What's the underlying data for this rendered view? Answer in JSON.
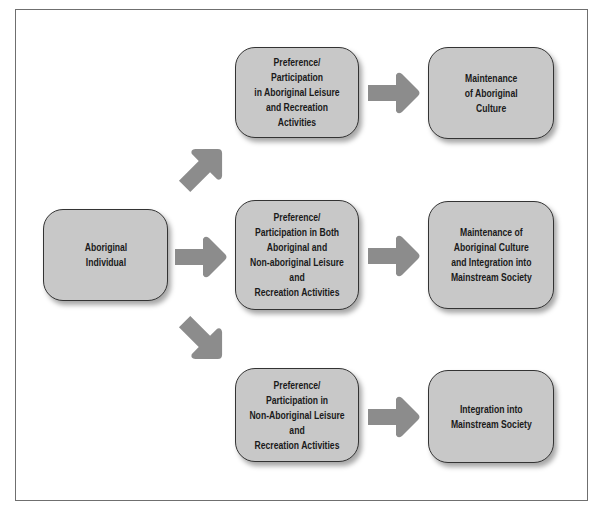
{
  "diagram": {
    "type": "flowchart",
    "colors": {
      "node_fill": "#c8c8c8",
      "node_border": "#333333",
      "arrow": "#8c8c8c",
      "frame": "#6f6f6f"
    },
    "nodes": {
      "source": {
        "label": "Aboriginal\nIndividual"
      },
      "mid_top": {
        "label": "Preference/\nParticipation\nin Aboriginal Leisure\nand Recreation Activities"
      },
      "mid_middle": {
        "label": "Preference/\nParticipation in Both\nAboriginal and\nNon-aboriginal Leisure and\nRecreation Activities"
      },
      "mid_bottom": {
        "label": "Preference/\nParticipation in\nNon-Aboriginal Leisure and\nRecreation Activities"
      },
      "out_top": {
        "label": "Maintenance\nof Aboriginal\nCulture"
      },
      "out_middle": {
        "label": "Maintenance of\nAboriginal Culture\nand Integration into\nMainstream Society"
      },
      "out_bottom": {
        "label": "Integration into\nMainstream Society"
      }
    },
    "edges": [
      {
        "from": "source",
        "to": "mid_top",
        "direction": "up-right"
      },
      {
        "from": "source",
        "to": "mid_middle",
        "direction": "right"
      },
      {
        "from": "source",
        "to": "mid_bottom",
        "direction": "down-right"
      },
      {
        "from": "mid_top",
        "to": "out_top",
        "direction": "right"
      },
      {
        "from": "mid_middle",
        "to": "out_middle",
        "direction": "right"
      },
      {
        "from": "mid_bottom",
        "to": "out_bottom",
        "direction": "right"
      }
    ]
  }
}
